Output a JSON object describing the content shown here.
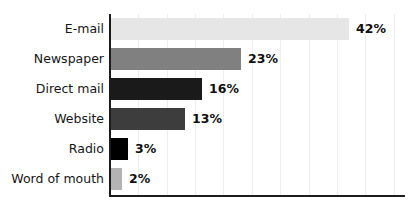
{
  "chart_data": {
    "type": "bar",
    "orientation": "horizontal",
    "title": "",
    "subtitle": "",
    "xlabel": "",
    "ylabel": "",
    "categories": [
      "E-mail",
      "Newspaper",
      "Direct mail",
      "Website",
      "Radio",
      "Word of mouth"
    ],
    "values": [
      42,
      23,
      16,
      13,
      3,
      2
    ],
    "value_labels": [
      "42%",
      "23%",
      "16%",
      "13%",
      "3%",
      "2%"
    ],
    "bar_colors": [
      "#e6e6e6",
      "#808080",
      "#1a1a1a",
      "#3d3d3d",
      "#000000",
      "#b3b3b3"
    ],
    "xlim": [
      0,
      52
    ],
    "grid": true,
    "grid_axis": "x",
    "gridline_step": 5,
    "legend": "none",
    "axis_color": "#1c1c1c",
    "gridline_color": "#ededed",
    "background": "#ffffff"
  }
}
